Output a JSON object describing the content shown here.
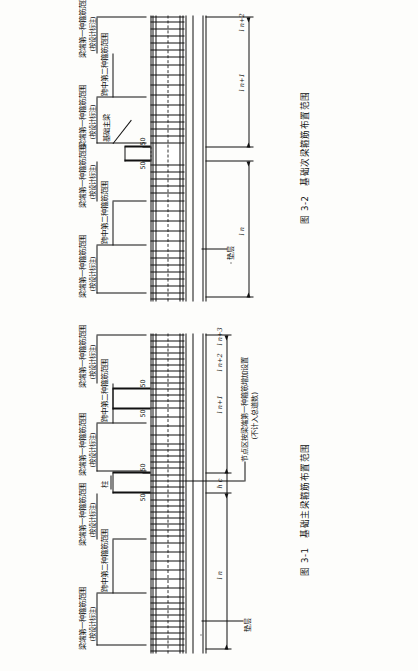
{
  "document": {
    "type": "structural-drawing",
    "language": "zh-CN",
    "description": "基础梁箍筋布置范围构造详图"
  },
  "figure_a": {
    "caption_number": "图 3-1",
    "caption_text": "基础主梁箍筋布置范围",
    "labels": {
      "column": "柱",
      "cushion": "垫层",
      "beam_end_range": "梁端第一种箍筋范围",
      "beam_end_note": "(按设计标注)",
      "midspan_range": "跨中第二种箍筋范围",
      "joint_zone_line1": "节点区按梁端第一种箍筋增加设置",
      "joint_zone_line2": "(不计入总道数)",
      "cover_50": "50"
    },
    "dimensions": {
      "hc": "h c",
      "ln": "l n",
      "ln1": "l n+1",
      "ln2": "l n+2",
      "ln3": "l n+3"
    },
    "segments": [
      {
        "id": "seg-bottom",
        "span_label": "l n"
      },
      {
        "id": "seg-mid",
        "span_label": "l n+1"
      },
      {
        "id": "seg-upper",
        "span_label": "l n+2"
      },
      {
        "id": "seg-top",
        "span_label": "l n+3"
      }
    ],
    "joints": [
      {
        "id": "joint-1",
        "height_label": "h c"
      },
      {
        "id": "joint-2",
        "height_label": "h c"
      },
      {
        "id": "joint-3",
        "height_label": "h c"
      }
    ]
  },
  "figure_b": {
    "caption_number": "图 3-2",
    "caption_text": "基础次梁箍筋布置范围",
    "labels": {
      "main_beam": "基础主梁",
      "cushion": "垫层",
      "beam_end_range": "梁端第一种箍筋范围",
      "beam_end_note": "(按设计标注)",
      "midspan_range": "跨中第二种箍筋范围",
      "cover_50": "50"
    },
    "dimensions": {
      "ln": "l n",
      "ln1": "l n+1",
      "ln2": "l n+2"
    },
    "segments": [
      {
        "id": "seg-lower",
        "span_label": "l n"
      },
      {
        "id": "seg-mid",
        "span_label": "l n+1"
      },
      {
        "id": "seg-upper",
        "span_label": "l n+2"
      }
    ]
  },
  "colors": {
    "ink": "#111111",
    "paper": "#fdfdfb",
    "dash": "#222222"
  }
}
